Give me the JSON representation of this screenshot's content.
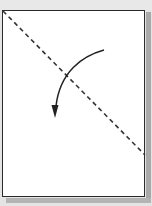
{
  "diagram": {
    "type": "origami-fold-step",
    "paper": {
      "shape": "rectangle",
      "fill": "#ffffff",
      "stroke": "#2a2a2a"
    },
    "fold_line": {
      "style": "dashed",
      "from": "top-left-corner",
      "to": "right-edge-lower",
      "color": "#333333"
    },
    "arrow": {
      "style": "curved",
      "direction": "down-left",
      "meaning": "fold-toward-viewer",
      "color": "#222222"
    },
    "colors": {
      "background": "#e4e4e4",
      "shadow": "#a9a9a9",
      "line": "#2a2a2a"
    }
  }
}
